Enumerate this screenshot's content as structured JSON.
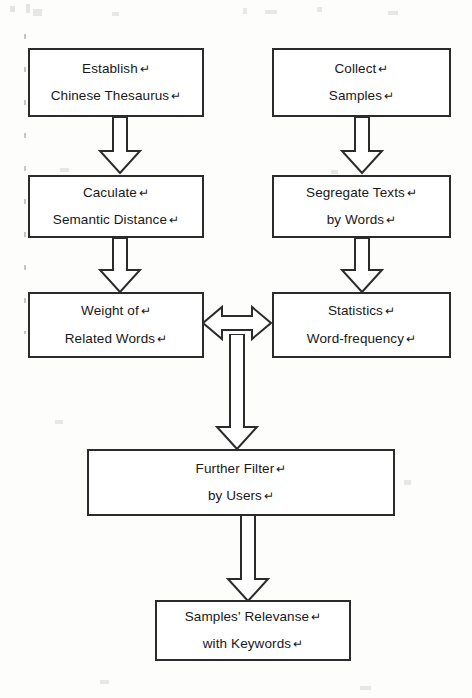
{
  "diagram": {
    "type": "flowchart",
    "cr_glyph": "↵",
    "nodes": [
      {
        "id": "establish",
        "lines": [
          "Establish",
          "Chinese Thesaurus"
        ]
      },
      {
        "id": "collect",
        "lines": [
          "Collect",
          "Samples"
        ]
      },
      {
        "id": "caculate",
        "lines": [
          "Caculate",
          "Semantic Distance"
        ]
      },
      {
        "id": "segregate",
        "lines": [
          "Segregate Texts",
          "by Words"
        ]
      },
      {
        "id": "weight",
        "lines": [
          "Weight of",
          "Related Words"
        ]
      },
      {
        "id": "statistics",
        "lines": [
          "Statistics",
          "Word-frequency"
        ]
      },
      {
        "id": "filter",
        "lines": [
          "Further Filter",
          "by Users"
        ]
      },
      {
        "id": "relevanse",
        "lines": [
          "Samples' Relevanse",
          "with Keywords"
        ]
      }
    ],
    "edges": [
      {
        "from": "establish",
        "to": "caculate",
        "style": "block-arrow",
        "direction": "down"
      },
      {
        "from": "collect",
        "to": "segregate",
        "style": "block-arrow",
        "direction": "down"
      },
      {
        "from": "caculate",
        "to": "weight",
        "style": "block-arrow",
        "direction": "down"
      },
      {
        "from": "segregate",
        "to": "statistics",
        "style": "block-arrow",
        "direction": "down"
      },
      {
        "from": "weight",
        "to": "statistics",
        "style": "block-arrow",
        "direction": "both"
      },
      {
        "from": "weight-statistics-link",
        "to": "filter",
        "style": "block-arrow",
        "direction": "down"
      },
      {
        "from": "filter",
        "to": "relevanse",
        "style": "block-arrow",
        "direction": "down"
      }
    ],
    "colors": {
      "background": "#fdfdfc",
      "box_border": "#2b2b2b",
      "box_fill": "#ffffff",
      "text": "#181818",
      "arrow_stroke": "#2b2b2b"
    }
  }
}
